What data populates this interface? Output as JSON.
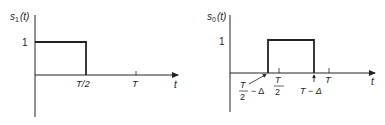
{
  "plots": [
    {
      "id": "s1",
      "ylabel": "s",
      "ylabel_sub": "1",
      "ylabel_arg": "(t)",
      "level_label": "1",
      "xlabel": "t",
      "ticks": [
        {
          "label": "T/2"
        },
        {
          "label": "T"
        }
      ],
      "pulse": {
        "start": "0",
        "end": "T/2",
        "amplitude": 1
      }
    },
    {
      "id": "s0",
      "ylabel": "s",
      "ylabel_sub": "0",
      "ylabel_arg": "(t)",
      "level_label": "1",
      "xlabel": "t",
      "ticks": [
        {
          "label_num": "T",
          "label_den": "2"
        },
        {
          "label": "T"
        }
      ],
      "annotations": [
        {
          "num": "T",
          "den": "2",
          "suffix": "− Δ"
        },
        {
          "label": "T − Δ"
        }
      ],
      "pulse": {
        "start": "T/2 − Δ",
        "end": "T − Δ",
        "amplitude": 1
      }
    }
  ],
  "colors": {
    "line": "#222222",
    "background": "#ffffff"
  }
}
